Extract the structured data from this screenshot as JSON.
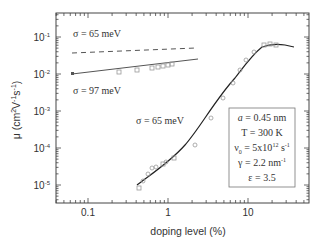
{
  "chart_data": {
    "type": "scatter",
    "title": "",
    "xlabel": "doping level (%)",
    "ylabel": "μ (cm²V⁻¹s⁻¹)",
    "xscale": "log",
    "yscale": "log",
    "xlim": [
      0.04,
      57
    ],
    "ylim": [
      3e-06,
      0.45
    ],
    "x_ticks": [
      "0.1",
      "1",
      "10"
    ],
    "y_ticks": [
      "10⁻⁵",
      "10⁻⁴",
      "10⁻³",
      "10⁻²",
      "10⁻¹"
    ],
    "grid": false,
    "annotations": [
      {
        "text": "σ = 65 meV",
        "near": "upper dashed line"
      },
      {
        "text": "σ = 97 meV",
        "near": "upper solid line"
      },
      {
        "text": "σ = 65 meV",
        "near": "main curve"
      }
    ],
    "parameter_box": [
      "a = 0.45 nm",
      "T = 300 K",
      "ν₀ = 5x10¹² s⁻¹",
      "γ = 2.2 nm⁻¹",
      "ε = 3.5"
    ],
    "series": [
      {
        "name": "σ = 65 meV (dashed)",
        "style": "dashed line",
        "x": [
          0.06,
          2.2
        ],
        "y": [
          0.037,
          0.05
        ]
      },
      {
        "name": "σ = 97 meV (solid)",
        "style": "solid line",
        "x": [
          0.06,
          2.3
        ],
        "y": [
          0.01,
          0.025
        ]
      },
      {
        "name": "data (low mobility)",
        "style": "open squares",
        "x": [
          0.38,
          0.51,
          0.85,
          1.1,
          1.4,
          1.6,
          1.8
        ],
        "y": [
          0.013,
          0.013,
          0.014,
          0.016,
          0.017,
          0.018,
          0.019
        ]
      },
      {
        "name": "σ = 65 meV fit",
        "style": "solid line",
        "x": [
          0.4,
          0.6,
          1,
          2,
          3,
          5,
          8,
          12,
          16,
          20,
          30,
          40
        ],
        "y": [
          1e-05,
          2e-05,
          4e-05,
          0.0002,
          0.0008,
          0.005,
          0.022,
          0.05,
          0.065,
          0.065,
          0.06,
          0.055
        ]
      },
      {
        "name": "data (main)",
        "style": "open circles/squares",
        "x": [
          0.4,
          0.45,
          0.55,
          0.65,
          0.8,
          0.95,
          1.1,
          2.1,
          3.2,
          4.5,
          6,
          7,
          9,
          12,
          15,
          18,
          22
        ],
        "y": [
          7e-06,
          1e-05,
          2e-05,
          2.5e-05,
          3e-05,
          3.5e-05,
          5e-05,
          0.0001,
          0.0006,
          0.003,
          0.01,
          0.02,
          0.04,
          0.06,
          0.065,
          0.065,
          0.062
        ]
      }
    ]
  },
  "labels": {
    "sigma65_top": "σ = 65 meV",
    "sigma97": "σ = 97 meV",
    "sigma65_mid": "σ = 65 meV",
    "xlabel": "doping level (%)",
    "ylabel": "μ (cm²V⁻¹s⁻¹)",
    "box": [
      "a = 0.45 nm",
      "T = 300 K",
      "ν₀ = 5x10¹² s⁻¹",
      "γ = 2.2 nm⁻¹",
      "ε = 3.5"
    ]
  }
}
